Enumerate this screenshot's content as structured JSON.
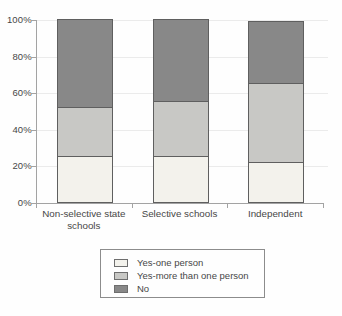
{
  "chart_data": {
    "type": "bar",
    "stacked": true,
    "title": "",
    "categories": [
      "Non-selective state schools",
      "Selective schools",
      "Independent"
    ],
    "series": [
      {
        "name": "Yes-one person",
        "values": [
          25,
          25,
          22
        ],
        "color": "#f3f2ec"
      },
      {
        "name": "Yes-more than one person",
        "values": [
          27,
          30,
          43
        ],
        "color": "#c8c8c5"
      },
      {
        "name": "No",
        "values": [
          48,
          45,
          34
        ],
        "color": "#888888"
      }
    ],
    "totals": [
      100,
      100,
      99
    ],
    "ylim": [
      0,
      100
    ],
    "ytick_labels": [
      "0%",
      "20%",
      "40%",
      "60%",
      "80%",
      "100%"
    ],
    "grid": true,
    "legend_position": "bottom",
    "colors": {
      "axis": "#a3a3a3",
      "gridline": "#ebebeb",
      "bar_border": "#5f5f5f",
      "text": "#474747",
      "legend_border": "#8c8c8c"
    }
  }
}
